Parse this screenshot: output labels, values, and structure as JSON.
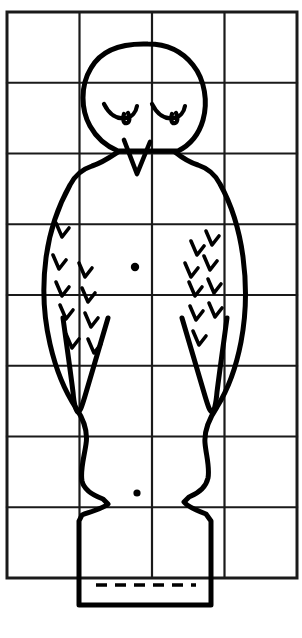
{
  "document": {
    "title": "Penguin Grid Drawing Template",
    "subject": "penguin",
    "style": "black-ink line drawing on square grid",
    "background_color": "#ffffff",
    "ink_color": "#000000",
    "grid_color": "#1a1a1a",
    "canvas": {
      "width": 302,
      "height": 638
    }
  },
  "grid": {
    "name": "drawing-grid",
    "columns": 4,
    "rows": 8,
    "cell_width": 72.5,
    "cell_height": 70.75,
    "x_lines": [
      7,
      79.5,
      152,
      224.5,
      297
    ],
    "y_lines": [
      12,
      82.75,
      153.5,
      224.25,
      295,
      365.75,
      436.5,
      507.25,
      578
    ],
    "border_stroke": 3,
    "inner_stroke": 2.2
  },
  "figure": {
    "name": "penguin-figure",
    "stroke_width": 5,
    "parts": [
      {
        "name": "head-outline",
        "label": "Head"
      },
      {
        "name": "left-eye",
        "label": "Left closed eye"
      },
      {
        "name": "right-eye",
        "label": "Right closed eye"
      },
      {
        "name": "beak",
        "label": "Beak"
      },
      {
        "name": "body-outline",
        "label": "Body and base"
      },
      {
        "name": "left-wing",
        "label": "Left wing"
      },
      {
        "name": "right-wing",
        "label": "Right wing"
      },
      {
        "name": "chest-dot",
        "label": "Chest dot"
      },
      {
        "name": "belly-dot",
        "label": "Belly dot"
      },
      {
        "name": "base-dashed-line",
        "label": "Dashed base line"
      },
      {
        "name": "feather-marks",
        "label": "Feather check marks"
      }
    ]
  },
  "paths": {
    "head": "M 148 44 C 119 43 100 52 91 68 C 80 86 81 110 90 126 C 96 137 106 146 118 151 L 150 151 L 178 151 C 190 145 199 134 203 120 C 208 102 205 80 193 65 C 182 51 166 44 148 44 Z",
    "body": "M 118 152 C 112 156 102 163 92 166 C 83 169 75 175 70 185 C 60 203 50 228 46 258 C 42 288 44 318 50 344 C 56 370 66 393 76 408 C 84 420 88 432 86 444 C 84 458 80 470 82 481 C 84 490 92 495 103 499 L 108 504 C 104 508 90 512 82 515 L 79 521 L 79 605 L 211 605 L 211 521 L 206 514 C 198 511 188 507 184 502 L 189 497 C 199 493 206 487 208 478 C 210 467 206 455 205 443 C 204 431 209 419 217 407 C 227 391 236 368 241 342 C 246 316 247 287 243 257 C 239 227 230 202 220 184 C 215 174 207 168 198 165 C 188 162 180 156 175 152",
    "beak": "M 124 140 L 137 174 L 150 142",
    "left_eye": "M 104 104 C 109 114 117 120 126 118 C 132 117 136 112 137 106 M 124 114 C 122 120 124 124 127 123 C 130 122 130 117 128 113",
    "right_eye": "M 152 104 C 157 114 165 120 174 118 C 180 117 184 112 185 106 M 172 114 C 170 120 172 124 175 123 C 178 122 178 117 176 113",
    "left_wing": "M 108 318 C 100 345 92 372 85 396 C 82 406 80 412 78 412 C 76 412 74 404 73 392 C 70 368 66 340 63 318",
    "right_wing": "M 182 318 C 190 345 198 372 205 396 C 208 406 210 412 212 412 C 214 412 216 404 217 392 C 220 368 224 340 227 318",
    "dashed_line": "M 96 585 L 196 585"
  },
  "feather_marks": {
    "stroke_width": 3.6,
    "left_column_outer": [
      {
        "x": 63,
        "y": 232
      },
      {
        "x": 60,
        "y": 264
      },
      {
        "x": 63,
        "y": 291
      },
      {
        "x": 67,
        "y": 314
      },
      {
        "x": 73,
        "y": 343
      }
    ],
    "left_column_inner": [
      {
        "x": 86,
        "y": 272
      },
      {
        "x": 89,
        "y": 297
      },
      {
        "x": 92,
        "y": 322
      },
      {
        "x": 95,
        "y": 348
      }
    ],
    "right_column_inner": [
      {
        "x": 198,
        "y": 250
      },
      {
        "x": 192,
        "y": 272
      },
      {
        "x": 196,
        "y": 291
      },
      {
        "x": 197,
        "y": 315
      },
      {
        "x": 200,
        "y": 340
      }
    ],
    "right_column_outer": [
      {
        "x": 213,
        "y": 240
      },
      {
        "x": 211,
        "y": 265
      },
      {
        "x": 215,
        "y": 288
      },
      {
        "x": 216,
        "y": 312
      }
    ]
  },
  "dots": {
    "chest": {
      "x": 135,
      "y": 267,
      "r": 4.2
    },
    "belly": {
      "x": 137,
      "y": 493,
      "r": 3.6
    }
  }
}
